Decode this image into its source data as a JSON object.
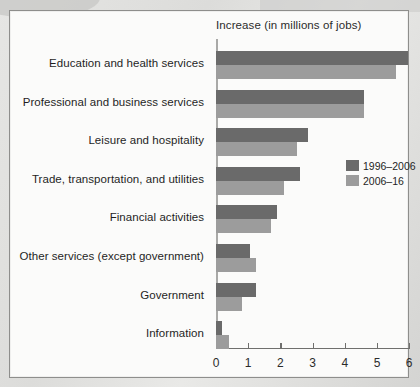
{
  "figure": {
    "title": "Increase (in millions of jobs)"
  },
  "chart_data": {
    "type": "bar",
    "orientation": "horizontal",
    "title": "Increase (in millions of jobs)",
    "xlabel": "Increase (in millions of jobs)",
    "ylabel": "",
    "xlim": [
      0,
      6
    ],
    "xticks": [
      "0",
      "1",
      "2",
      "3",
      "4",
      "5",
      "6"
    ],
    "grid": false,
    "legend_position": "middle-right",
    "categories": [
      "Education and health services",
      "Professional and business services",
      "Leisure and hospitality",
      "Trade, transportation, and utilities",
      "Financial activities",
      "Other services (except government)",
      "Government",
      "Information"
    ],
    "series": [
      {
        "name": "1996–2006",
        "color": "#6a6a6a",
        "values": [
          5.95,
          4.6,
          2.85,
          2.6,
          1.9,
          1.05,
          1.25,
          0.2
        ]
      },
      {
        "name": "2006–16",
        "color": "#9c9c9c",
        "values": [
          5.6,
          4.6,
          2.5,
          2.1,
          1.7,
          1.25,
          0.8,
          0.4
        ]
      }
    ]
  },
  "legend": {
    "items": [
      {
        "label": "1996–2006",
        "color": "#6a6a6a"
      },
      {
        "label": "2006–16",
        "color": "#9c9c9c"
      }
    ]
  }
}
